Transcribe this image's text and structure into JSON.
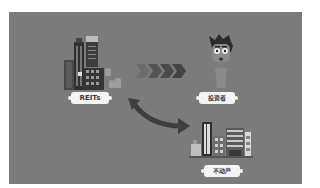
{
  "diagram": {
    "nodes": [
      {
        "id": "reits",
        "label": "REITs",
        "icon": "city-buildings-coins-icon"
      },
      {
        "id": "investor",
        "label": "投资者",
        "icon": "investor-character-icon"
      },
      {
        "id": "real_estate",
        "label": "不动产",
        "icon": "real-estate-buildings-icon"
      }
    ],
    "edges": [
      {
        "from": "reits",
        "to": "investor",
        "style": "chevron-arrows",
        "direction": "one-way"
      },
      {
        "from": "reits",
        "to": "real_estate",
        "style": "curved-arrow",
        "direction": "two-way"
      }
    ]
  },
  "colors": {
    "background": "#7b7b7b",
    "label_bg": "#f4f4f4",
    "label_text": "#3a3a3a",
    "arrow_dark": "#3e3e3e",
    "chevron_light": "#6a6a6a"
  }
}
